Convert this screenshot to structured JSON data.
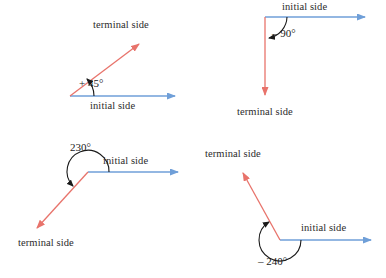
{
  "figure": {
    "background_color": "#ffffff",
    "initial_side_color": "#6f9fd8",
    "terminal_side_color": "#e8736b",
    "arc_color": "#1a1a1a",
    "text_color": "#2b2b2b"
  },
  "diagrams": [
    {
      "id": "angle-plus-45",
      "angle_label": "+ 45°",
      "angle_value": 45,
      "direction": "counterclockwise",
      "initial_side_label": "initial side",
      "terminal_side_label": "terminal side",
      "vertex": [
        70,
        96
      ],
      "initial_tip": [
        182,
        96
      ],
      "terminal_tip": [
        144,
        39
      ]
    },
    {
      "id": "angle-minus-90",
      "angle_label": "– 90°",
      "angle_value": -90,
      "direction": "clockwise",
      "initial_side_label": "initial side",
      "terminal_side_label": "terminal side",
      "vertex": [
        265,
        17
      ],
      "initial_tip": [
        372,
        17
      ],
      "terminal_tip": [
        265,
        101
      ]
    },
    {
      "id": "angle-230",
      "angle_label": "230°",
      "angle_value": 230,
      "direction": "counterclockwise",
      "initial_side_label": "initial side",
      "terminal_side_label": "terminal side",
      "vertex": [
        88,
        172
      ],
      "initial_tip": [
        185,
        172
      ],
      "terminal_tip": [
        31,
        233
      ]
    },
    {
      "id": "angle-minus-240",
      "angle_label": "– 240°",
      "angle_value": -240,
      "direction": "clockwise",
      "initial_side_label": "initial side",
      "terminal_side_label": "terminal side",
      "vertex": [
        280,
        240
      ],
      "initial_tip": [
        378,
        240
      ],
      "terminal_tip": [
        238,
        167
      ]
    }
  ],
  "labels": {
    "d1_terminal": "terminal side",
    "d1_initial": "initial side",
    "d1_angle": "+ 45°",
    "d2_initial": "initial side",
    "d2_terminal": "terminal side",
    "d2_angle": "– 90°",
    "d3_initial": "initial side",
    "d3_terminal": "terminal side",
    "d3_angle": "230°",
    "d4_terminal": "terminal side",
    "d4_initial": "initial side",
    "d4_angle": "– 240°"
  }
}
